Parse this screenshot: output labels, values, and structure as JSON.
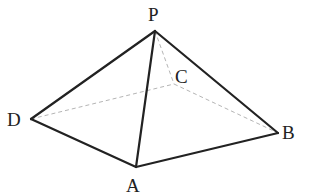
{
  "figure": {
    "type": "pyramid",
    "vertices": [
      {
        "id": "P",
        "label": "P"
      },
      {
        "id": "A",
        "label": "A"
      },
      {
        "id": "B",
        "label": "B"
      },
      {
        "id": "C",
        "label": "C"
      },
      {
        "id": "D",
        "label": "D"
      }
    ],
    "visible_edges": [
      [
        "P",
        "D"
      ],
      [
        "P",
        "A"
      ],
      [
        "P",
        "B"
      ],
      [
        "D",
        "A"
      ],
      [
        "A",
        "B"
      ]
    ],
    "hidden_edges": [
      [
        "P",
        "C"
      ],
      [
        "D",
        "C"
      ],
      [
        "C",
        "B"
      ]
    ],
    "colors": {
      "line": "#222222",
      "hidden_line": "#b5b5b5",
      "background": "#ffffff"
    }
  }
}
